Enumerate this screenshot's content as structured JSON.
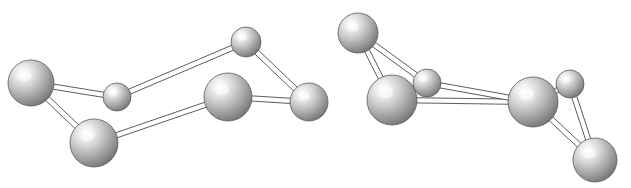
{
  "figure": {
    "title": "",
    "caption": "",
    "type": "ball-and-stick molecular structure illustration",
    "background_color": "#ffffff",
    "atom_fill_light": "#f2f2f2",
    "atom_fill_mid": "#b0b0b0",
    "atom_fill_dark": "#6e6e6e",
    "atom_outline_color": "#5a5a5a",
    "bond_stroke_color": "#4a4a4a",
    "bond_fill_color": "#ffffff",
    "molecule_count": 2
  },
  "molecules": [
    {
      "name": "molecule-left",
      "label": "",
      "atoms": [
        {
          "id": "L1",
          "name": "atom-large-upper-left",
          "cx": 31,
          "cy": 83,
          "r": 23,
          "size": "large"
        },
        {
          "id": "L2",
          "name": "atom-small-upper-mid",
          "cx": 117,
          "cy": 97,
          "r": 14,
          "size": "small"
        },
        {
          "id": "L3",
          "name": "atom-large-lower-left",
          "cx": 94,
          "cy": 143,
          "r": 24,
          "size": "large"
        },
        {
          "id": "L4",
          "name": "atom-small-top",
          "cx": 246,
          "cy": 42,
          "r": 15,
          "size": "small"
        },
        {
          "id": "L5",
          "name": "atom-large-center-right",
          "cx": 228,
          "cy": 97,
          "r": 24,
          "size": "large"
        },
        {
          "id": "L6",
          "name": "atom-medium-right-edge",
          "cx": 309,
          "cy": 102,
          "r": 19,
          "size": "medium"
        }
      ],
      "bonds": [
        {
          "from": "L1",
          "to": "L2",
          "name": "bond-L1-L2"
        },
        {
          "from": "L1",
          "to": "L3",
          "name": "bond-L1-L3"
        },
        {
          "from": "L2",
          "to": "L4",
          "name": "bond-L2-L4"
        },
        {
          "from": "L3",
          "to": "L5",
          "name": "bond-L3-L5"
        },
        {
          "from": "L4",
          "to": "L6",
          "name": "bond-L4-L6"
        },
        {
          "from": "L5",
          "to": "L6",
          "name": "bond-L5-L6"
        }
      ]
    },
    {
      "name": "molecule-right",
      "label": "",
      "atoms": [
        {
          "id": "R1",
          "name": "atom-medium-top-left",
          "cx": 358,
          "cy": 33,
          "r": 20,
          "size": "medium"
        },
        {
          "id": "R2",
          "name": "atom-large-left",
          "cx": 392,
          "cy": 100,
          "r": 25,
          "size": "large"
        },
        {
          "id": "R3",
          "name": "atom-small-left-inner",
          "cx": 427,
          "cy": 83,
          "r": 14,
          "size": "small"
        },
        {
          "id": "R4",
          "name": "atom-large-right",
          "cx": 533,
          "cy": 102,
          "r": 25,
          "size": "large"
        },
        {
          "id": "R5",
          "name": "atom-small-right-inner",
          "cx": 570,
          "cy": 84,
          "r": 14,
          "size": "small"
        },
        {
          "id": "R6",
          "name": "atom-medium-bottom-right",
          "cx": 595,
          "cy": 160,
          "r": 22,
          "size": "medium"
        }
      ],
      "bonds": [
        {
          "from": "R1",
          "to": "R2",
          "name": "bond-R1-R2"
        },
        {
          "from": "R1",
          "to": "R3",
          "name": "bond-R1-R3"
        },
        {
          "from": "R2",
          "to": "R3",
          "name": "bond-R2-R3"
        },
        {
          "from": "R2",
          "to": "R4",
          "name": "bond-R2-R4"
        },
        {
          "from": "R3",
          "to": "R4",
          "name": "bond-R3-R4"
        },
        {
          "from": "R4",
          "to": "R5",
          "name": "bond-R4-R5"
        },
        {
          "from": "R4",
          "to": "R6",
          "name": "bond-R4-R6"
        },
        {
          "from": "R5",
          "to": "R6",
          "name": "bond-R5-R6"
        }
      ]
    }
  ]
}
